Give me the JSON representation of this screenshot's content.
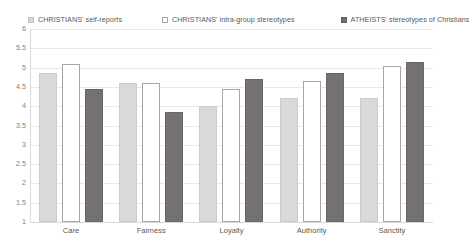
{
  "chart_data": {
    "type": "bar",
    "title": "",
    "xlabel": "",
    "ylabel": "",
    "ylim": [
      1,
      6
    ],
    "yticks": [
      "1",
      "1.5",
      "2",
      "2.5",
      "3",
      "3.5",
      "4",
      "4.5",
      "5",
      "5.5",
      "6"
    ],
    "ytick_values": [
      1,
      1.5,
      2,
      2.5,
      3,
      3.5,
      4,
      4.5,
      5,
      5.5,
      6
    ],
    "grid": true,
    "legend_position": "top",
    "categories": [
      "Care",
      "Fairness",
      "Loyalty",
      "Authority",
      "Sanctity"
    ],
    "series": [
      {
        "name": "CHRISTIANS' self-reports",
        "color": "#d9d9d9",
        "marker": "filled-light-gray-square",
        "values": [
          4.85,
          4.6,
          4.0,
          4.2,
          4.2
        ]
      },
      {
        "name": "CHRISTIANS' intra-group stereotypes",
        "color": "#ffffff",
        "marker": "open-white-square",
        "values": [
          5.1,
          4.6,
          4.45,
          4.65,
          5.05
        ]
      },
      {
        "name": "ATHEISTS' stereotypes of Christians",
        "color": "#767171",
        "marker": "filled-dark-gray-square",
        "values": [
          4.45,
          3.85,
          4.7,
          4.85,
          5.15
        ]
      }
    ]
  },
  "colors": {
    "series_1": "#d9d9d9",
    "series_2": "#ffffff",
    "series_3": "#767171",
    "gridline": "#e8e8e8",
    "axis": "#d9d9d9",
    "text": "#595959",
    "tick_text": "#808080",
    "background": "#ffffff"
  }
}
